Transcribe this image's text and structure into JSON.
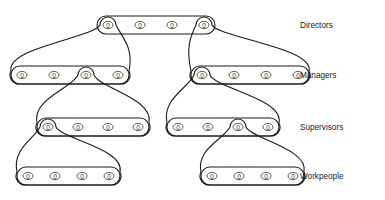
{
  "diagram": {
    "type": "organisational-hierarchy-venn",
    "node_symbol": "0",
    "levels": [
      {
        "id": "directors",
        "label": "Directors",
        "y": 25,
        "label_x": 300,
        "groups": [
          {
            "id": "directors-group",
            "x_start": 108,
            "x_step": 32,
            "count": 4,
            "nodes": [
              "0",
              "0",
              "0",
              "0"
            ]
          }
        ]
      },
      {
        "id": "managers",
        "label": "Managers",
        "y": 75,
        "label_x": 300,
        "groups": [
          {
            "id": "managers-left-group",
            "x_start": 22,
            "x_step": 32,
            "count": 4,
            "nodes": [
              "0",
              "0",
              "0",
              "0"
            ]
          },
          {
            "id": "managers-right-group",
            "x_start": 202,
            "x_step": 32,
            "count": 4,
            "nodes": [
              "0",
              "0",
              "0",
              "0"
            ]
          }
        ]
      },
      {
        "id": "supervisors",
        "label": "Supervisors",
        "y": 127,
        "label_x": 300,
        "groups": [
          {
            "id": "supervisors-left-group",
            "x_start": 48,
            "x_step": 30,
            "count": 4,
            "nodes": [
              "0",
              "0",
              "0",
              "0"
            ]
          },
          {
            "id": "supervisors-right-group",
            "x_start": 178,
            "x_step": 30,
            "count": 4,
            "nodes": [
              "0",
              "0",
              "0",
              "0"
            ]
          }
        ]
      },
      {
        "id": "workpeople",
        "label": "Workpeople",
        "y": 176,
        "label_x": 300,
        "groups": [
          {
            "id": "workpeople-left-group",
            "x_start": 28,
            "x_step": 27,
            "count": 4,
            "nodes": [
              "0",
              "0",
              "0",
              "0"
            ]
          },
          {
            "id": "workpeople-right-group",
            "x_start": 212,
            "x_step": 27,
            "count": 4,
            "nodes": [
              "0",
              "0",
              "0",
              "0"
            ]
          }
        ]
      }
    ],
    "links": [
      {
        "id": "link-director1-managers-left",
        "parent_level": "directors",
        "parent_index": 0,
        "child_group": "managers-left-group"
      },
      {
        "id": "link-director4-managers-right",
        "parent_level": "directors",
        "parent_index": 3,
        "child_group": "managers-right-group"
      },
      {
        "id": "link-managerL3-supervisors-left",
        "parent_level": "managers",
        "parent_index": 2,
        "child_group": "supervisors-left-group"
      },
      {
        "id": "link-managerR1-supervisors-right",
        "parent_level": "managers",
        "parent_index": 4,
        "child_group": "supervisors-right-group"
      },
      {
        "id": "link-supervisorL1-workpeople-left",
        "parent_level": "supervisors",
        "parent_index": 0,
        "child_group": "workpeople-left-group"
      },
      {
        "id": "link-supervisorR3-workpeople-right",
        "parent_level": "supervisors",
        "parent_index": 6,
        "child_group": "workpeople-right-group"
      }
    ],
    "colors": {
      "stroke": "#1a1a1a",
      "node_stroke": "#2a2a2a",
      "text": "#1a1a1a",
      "background": "#ffffff"
    }
  }
}
